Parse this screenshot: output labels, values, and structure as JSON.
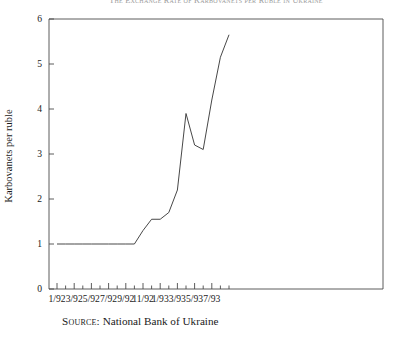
{
  "chart_data": {
    "type": "line",
    "title": "The Exchange Rate of Karbovanets per Ruble in Ukraine",
    "xlabel": "",
    "ylabel": "Karbovanets per ruble",
    "ylim": [
      0,
      6
    ],
    "yticks": [
      0,
      1,
      2,
      3,
      4,
      5,
      6
    ],
    "ytick_labels": [
      "0",
      "1",
      "2",
      "3",
      "4",
      "5",
      "6"
    ],
    "grid": false,
    "legend": "none",
    "x": [
      "1/92",
      "2/92",
      "3/92",
      "4/92",
      "5/92",
      "6/92",
      "7/92",
      "8/92",
      "9/92",
      "10/92",
      "11/92",
      "12/92",
      "1/93",
      "2/93",
      "3/93",
      "4/93",
      "5/93",
      "6/93",
      "7/93",
      "8/93",
      "9/93"
    ],
    "xtick_labels": [
      "1/92",
      "3/92",
      "5/92",
      "7/92",
      "9/92",
      "11/92",
      "1/93",
      "3/93",
      "5/93",
      "7/93"
    ],
    "xtick_label_indices": [
      0,
      2,
      4,
      6,
      8,
      10,
      12,
      14,
      16,
      18
    ],
    "values": [
      1.0,
      1.0,
      1.0,
      1.0,
      1.0,
      1.0,
      1.0,
      1.0,
      1.0,
      1.0,
      1.3,
      1.55,
      1.55,
      1.7,
      2.2,
      3.9,
      3.2,
      3.1,
      4.2,
      5.15,
      5.65
    ],
    "series_name": "Karbovanets per ruble",
    "line_color": "#3d3d3d",
    "annotations": []
  },
  "source": {
    "label": "Source:",
    "text": "National Bank of Ukraine"
  }
}
